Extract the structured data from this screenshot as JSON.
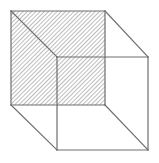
{
  "figure": {
    "canvas": {
      "width": 159,
      "height": 163,
      "background_color": "#ffffff"
    },
    "style": {
      "line_color": "#6e6e6e",
      "line_width": 1.2,
      "hatch_color": "#7a7a7a",
      "hatch_angle_degrees": 45,
      "hatch_spacing_px": 3,
      "hatch_line_width": 1,
      "hatch_fill_background": "#ffffff"
    },
    "vertices": {
      "front_top_left": [
        11,
        11
      ],
      "front_top_right": [
        105,
        11
      ],
      "front_bottom_right": [
        105,
        105
      ],
      "front_bottom_left": [
        11,
        105
      ],
      "back_top_left": [
        57,
        57
      ],
      "back_top_right": [
        148,
        57
      ],
      "back_bottom_right": [
        148,
        150
      ],
      "back_bottom_left": [
        57,
        150
      ]
    },
    "faces": [
      {
        "name": "front-face",
        "hatched": true,
        "points": "11,11 105,11 105,105 11,105"
      },
      {
        "name": "back-face",
        "hatched": false,
        "points": "57,57 148,57 148,150 57,150"
      }
    ],
    "edges": [
      {
        "name": "front-top-edge",
        "x1": 11,
        "y1": 11,
        "x2": 105,
        "y2": 11
      },
      {
        "name": "front-right-edge",
        "x1": 105,
        "y1": 11,
        "x2": 105,
        "y2": 105
      },
      {
        "name": "front-bottom-edge",
        "x1": 11,
        "y1": 105,
        "x2": 105,
        "y2": 105
      },
      {
        "name": "front-left-edge",
        "x1": 11,
        "y1": 11,
        "x2": 11,
        "y2": 105
      },
      {
        "name": "back-top-edge",
        "x1": 57,
        "y1": 57,
        "x2": 148,
        "y2": 57
      },
      {
        "name": "back-right-edge",
        "x1": 148,
        "y1": 57,
        "x2": 148,
        "y2": 150
      },
      {
        "name": "back-bottom-edge",
        "x1": 57,
        "y1": 150,
        "x2": 148,
        "y2": 150
      },
      {
        "name": "back-left-edge",
        "x1": 57,
        "y1": 57,
        "x2": 57,
        "y2": 150
      },
      {
        "name": "connector-top-left",
        "x1": 11,
        "y1": 11,
        "x2": 57,
        "y2": 57
      },
      {
        "name": "connector-top-right",
        "x1": 105,
        "y1": 11,
        "x2": 148,
        "y2": 57
      },
      {
        "name": "connector-bottom-right",
        "x1": 105,
        "y1": 105,
        "x2": 148,
        "y2": 150
      },
      {
        "name": "connector-bottom-left",
        "x1": 11,
        "y1": 105,
        "x2": 57,
        "y2": 150
      }
    ]
  }
}
